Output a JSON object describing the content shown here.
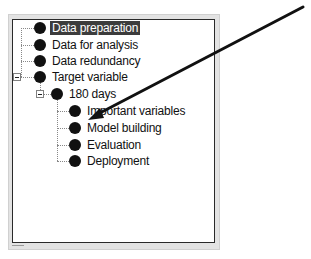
{
  "tree": {
    "selected": "Data preparation",
    "nodes": [
      {
        "label": "Data preparation",
        "level": 0,
        "selected": true
      },
      {
        "label": "Data for analysis",
        "level": 0
      },
      {
        "label": "Data redundancy",
        "level": 0
      },
      {
        "label": "Target variable",
        "level": 0,
        "expanded": true
      },
      {
        "label": "180 days",
        "level": 1,
        "expanded": true
      },
      {
        "label": "Important variables",
        "level": 2
      },
      {
        "label": "Model building",
        "level": 2
      },
      {
        "label": "Evaluation",
        "level": 2
      },
      {
        "label": "Deployment",
        "level": 2
      }
    ]
  },
  "annotation": {
    "type": "arrow",
    "color": "#111111",
    "points_to": "Model building"
  }
}
